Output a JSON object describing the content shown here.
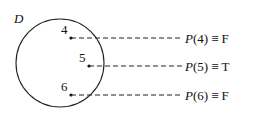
{
  "diagram": {
    "set_label": "D",
    "elements": [
      {
        "value": "4",
        "statement": "P(4) ≡ F",
        "p": "P",
        "arg": "(4)",
        "eq": "≡",
        "truth": "F"
      },
      {
        "value": "5",
        "statement": "P(5) ≡ T",
        "p": "P",
        "arg": "(5)",
        "eq": "≡",
        "truth": "T"
      },
      {
        "value": "6",
        "statement": "P(6) ≡ F",
        "p": "P",
        "arg": "(6)",
        "eq": "≡",
        "truth": "F"
      }
    ]
  }
}
